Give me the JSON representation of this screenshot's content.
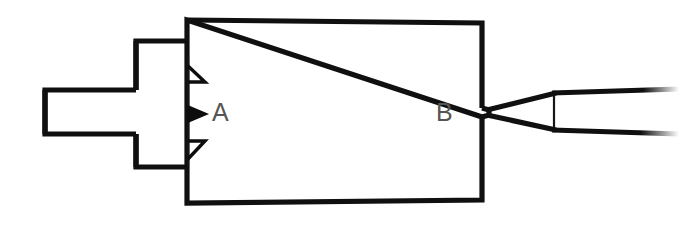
{
  "diagram": {
    "kind": "line-drawing",
    "canvas": {
      "width": 679,
      "height": 236,
      "background": "#ffffff"
    },
    "ink_color": "#101010",
    "label_color": "#555555",
    "labels": [
      {
        "id": "label-a",
        "text": "A",
        "x": 212,
        "y": 121,
        "refers_to": "main-chamber"
      },
      {
        "id": "label-b",
        "text": "B",
        "x": 436,
        "y": 121,
        "refers_to": "throat"
      }
    ],
    "parts": [
      {
        "id": "inlet-duct",
        "name": "inlet-duct",
        "shape": "rectangle",
        "x": 43,
        "y": 90,
        "width": 93,
        "height": 44
      },
      {
        "id": "neck-block",
        "name": "neck-block",
        "shape": "rectangle",
        "x": 134,
        "y": 40,
        "width": 53,
        "height": 128
      },
      {
        "id": "main-chamber",
        "name": "main-chamber",
        "shape": "quadrilateral",
        "points": "187,20 482,23 482,200 187,203",
        "label": "A"
      },
      {
        "id": "throat",
        "name": "throat",
        "shape": "pinch",
        "x": 482,
        "y": 112,
        "gap": 9,
        "label": "B"
      },
      {
        "id": "nozzle-cone",
        "name": "diverging-nozzle-cone",
        "shape": "wedge",
        "apex_x": 482,
        "apex_y": 112,
        "end_x": 553,
        "top_y": 93,
        "bottom_y": 130
      },
      {
        "id": "exhaust-duct",
        "name": "exhaust-duct",
        "shape": "open-duct",
        "start_x": 553,
        "end_x": 676,
        "top_y": 93,
        "bottom_y": 130,
        "note": "lines taper and fade toward the right edge"
      },
      {
        "id": "nozzle-seam",
        "name": "nozzle-seam-line",
        "shape": "vertical-line",
        "x": 553,
        "y1": 93,
        "y2": 130
      }
    ],
    "flow_arrows": [
      {
        "id": "arrow-top",
        "name": "flow-arrow-top",
        "style": "open-triangle",
        "tip_x": 205,
        "tip_y": 82,
        "base_x": 188,
        "base_top_y": 66,
        "direction": "right-down"
      },
      {
        "id": "arrow-middle",
        "name": "flow-arrow-middle",
        "style": "filled-triangle",
        "tip_x": 207,
        "tip_y": 114,
        "base_x": 188,
        "direction": "right"
      },
      {
        "id": "arrow-bottom",
        "name": "flow-arrow-bottom",
        "style": "open-triangle",
        "tip_x": 205,
        "tip_y": 141,
        "base_x": 188,
        "base_bottom_y": 159,
        "direction": "right-up"
      }
    ],
    "guide_lines": [
      {
        "id": "injector-face",
        "name": "injector-face-line",
        "x": 188,
        "y1": 55,
        "y2": 168
      }
    ]
  }
}
